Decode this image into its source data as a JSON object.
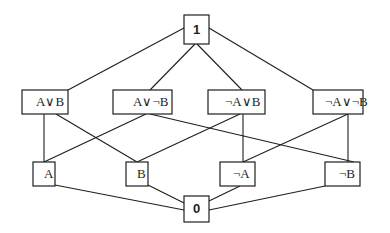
{
  "diagram": {
    "type": "lattice",
    "nodes": [
      {
        "id": "top",
        "label": "1",
        "level": 0
      },
      {
        "id": "AorB",
        "label": "A∨B",
        "level": 1
      },
      {
        "id": "AorNotB",
        "label": "A∨¬B",
        "level": 1
      },
      {
        "id": "NotAorB",
        "label": "¬A∨B",
        "level": 1
      },
      {
        "id": "NotAorNotB",
        "label": "¬A∨¬B",
        "level": 1
      },
      {
        "id": "A",
        "label": "A",
        "level": 2
      },
      {
        "id": "B",
        "label": "B",
        "level": 2
      },
      {
        "id": "NotA",
        "label": "¬A",
        "level": 2
      },
      {
        "id": "NotB",
        "label": "¬B",
        "level": 2
      },
      {
        "id": "bottom",
        "label": "0",
        "level": 3
      }
    ],
    "edges": [
      {
        "from": "top",
        "to": "AorB"
      },
      {
        "from": "top",
        "to": "AorNotB"
      },
      {
        "from": "top",
        "to": "NotAorB"
      },
      {
        "from": "top",
        "to": "NotAorNotB"
      },
      {
        "from": "AorB",
        "to": "A"
      },
      {
        "from": "AorB",
        "to": "B"
      },
      {
        "from": "AorNotB",
        "to": "A"
      },
      {
        "from": "AorNotB",
        "to": "NotB"
      },
      {
        "from": "NotAorB",
        "to": "B"
      },
      {
        "from": "NotAorB",
        "to": "NotA"
      },
      {
        "from": "NotAorNotB",
        "to": "NotA"
      },
      {
        "from": "NotAorNotB",
        "to": "NotB"
      },
      {
        "from": "A",
        "to": "bottom"
      },
      {
        "from": "B",
        "to": "bottom"
      },
      {
        "from": "NotA",
        "to": "bottom"
      },
      {
        "from": "NotB",
        "to": "bottom"
      }
    ]
  }
}
